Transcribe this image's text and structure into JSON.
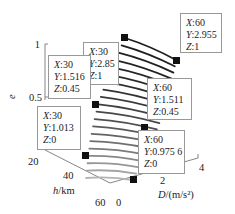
{
  "chart_data": {
    "type": "surface3d",
    "title": "",
    "axes": {
      "x": {
        "label": "h/km",
        "ticks": [
          "20",
          "40",
          "60"
        ],
        "range": [
          20,
          60
        ]
      },
      "y": {
        "label": "D/(m/s²)",
        "ticks": [
          "0",
          "2",
          "4"
        ],
        "range": [
          0,
          4
        ]
      },
      "z": {
        "label": "e",
        "ticks": [
          "0.5",
          "1"
        ],
        "range": [
          0,
          1
        ]
      }
    },
    "surface_lines": 20,
    "data_tips": [
      {
        "X": "60",
        "Y": "2.955",
        "Z": "1"
      },
      {
        "X": "30",
        "Y": "2.85",
        "Z": "1"
      },
      {
        "X": "30",
        "Y": "1.516",
        "Z": "0.45"
      },
      {
        "X": "60",
        "Y": "1.511",
        "Z": "0.45"
      },
      {
        "X": "30",
        "Y": "1.013",
        "Z": "0"
      },
      {
        "X": "60",
        "Y": "0.975 6",
        "Z": "0"
      }
    ],
    "points": [
      {
        "x": 30,
        "y": 2.85,
        "z": 1
      },
      {
        "x": 60,
        "y": 2.955,
        "z": 1
      },
      {
        "x": 30,
        "y": 1.516,
        "z": 0.45
      },
      {
        "x": 60,
        "y": 1.511,
        "z": 0.45
      },
      {
        "x": 30,
        "y": 1.013,
        "z": 0
      },
      {
        "x": 60,
        "y": 0.9756,
        "z": 0
      }
    ],
    "grid": false,
    "legend": null
  },
  "labels": {
    "z_axis": "e",
    "x_axis": "h/km",
    "y_axis_italic": "D",
    "y_axis_unit": "/(m/s²)",
    "z_tick_1": "1",
    "z_tick_05": "0.5",
    "x_tick_20": "20",
    "x_tick_40": "40",
    "x_tick_60": "60",
    "y_tick_0": "0",
    "y_tick_2": "2",
    "y_tick_4": "4"
  },
  "key_labels": {
    "x": "X",
    "y": "Y",
    "z": "Z"
  }
}
